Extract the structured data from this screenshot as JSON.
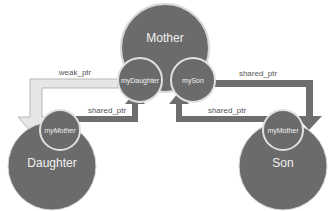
{
  "diagram": {
    "colors": {
      "node_fill": "#6b6b6b",
      "node_stroke": "#d9d9d9",
      "text_light": "#f2f2f2",
      "shared_arrow": "#6e6e6e",
      "weak_arrow_fill": "#e6e6e6",
      "weak_arrow_stroke": "#b5b5b5",
      "label_text": "#555555"
    },
    "nodes": [
      {
        "id": "mother",
        "label": "Mother",
        "members": [
          "myDaughter",
          "mySon"
        ]
      },
      {
        "id": "daughter",
        "label": "Daughter",
        "members": [
          "myMother"
        ]
      },
      {
        "id": "son",
        "label": "Son",
        "members": [
          "myMother"
        ]
      }
    ],
    "mother": {
      "label": "Mother",
      "member_daughter": "myDaughter",
      "member_son": "mySon"
    },
    "daughter": {
      "label": "Daughter",
      "member_mother": "myMother"
    },
    "son": {
      "label": "Son",
      "member_mother": "myMother"
    },
    "edges": [
      {
        "from": "mother.myDaughter",
        "to": "daughter",
        "label": "weak_ptr",
        "style": "weak"
      },
      {
        "from": "daughter.myMother",
        "to": "mother",
        "label": "shared_ptr",
        "style": "shared"
      },
      {
        "from": "son.myMother",
        "to": "mother",
        "label": "shared_ptr",
        "style": "shared"
      },
      {
        "from": "mother.mySon",
        "to": "son",
        "label": "shared_ptr",
        "style": "shared"
      }
    ],
    "edge_labels": {
      "weak": "weak_ptr",
      "daughter_to_mother": "shared_ptr",
      "son_to_mother": "shared_ptr",
      "mother_to_son": "shared_ptr"
    }
  }
}
